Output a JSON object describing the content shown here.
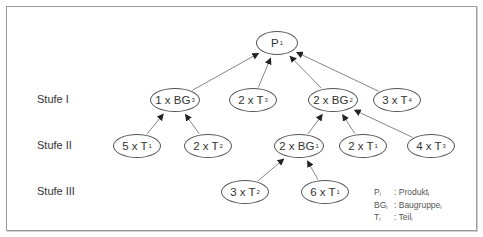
{
  "diagram": {
    "type": "tree",
    "direction": "bottom-up arrows (child to parent)",
    "levels": [
      {
        "id": "level-1",
        "label": "Stufe I",
        "y": 100
      },
      {
        "id": "level-2",
        "label": "Stufe II",
        "y": 146
      },
      {
        "id": "level-3",
        "label": "Stufe III",
        "y": 192
      }
    ],
    "nodes": [
      {
        "id": "p1",
        "qty": "",
        "sym": "P",
        "sub": "1",
        "cx": 277,
        "cy": 43,
        "w": 42,
        "h": 24
      },
      {
        "id": "bg3",
        "qty": "1 x ",
        "sym": "BG",
        "sub": "3",
        "cx": 175,
        "cy": 100,
        "w": 50,
        "h": 24
      },
      {
        "id": "t3a",
        "qty": "2 x ",
        "sym": "T",
        "sub": "3",
        "cx": 253,
        "cy": 100,
        "w": 48,
        "h": 24
      },
      {
        "id": "bg2",
        "qty": "2 x ",
        "sym": "BG",
        "sub": "2",
        "cx": 333,
        "cy": 100,
        "w": 50,
        "h": 24
      },
      {
        "id": "t4",
        "qty": "3 x ",
        "sym": "T",
        "sub": "4",
        "cx": 397,
        "cy": 100,
        "w": 48,
        "h": 24
      },
      {
        "id": "t1a",
        "qty": "5 x ",
        "sym": "T",
        "sub": "1",
        "cx": 137,
        "cy": 146,
        "w": 48,
        "h": 24
      },
      {
        "id": "t2a",
        "qty": "2 x ",
        "sym": "T",
        "sub": "2",
        "cx": 208,
        "cy": 146,
        "w": 48,
        "h": 24
      },
      {
        "id": "bg1",
        "qty": "2 x ",
        "sym": "BG",
        "sub": "1",
        "cx": 299,
        "cy": 146,
        "w": 50,
        "h": 24
      },
      {
        "id": "t1b",
        "qty": "2 x ",
        "sym": "T",
        "sub": "1",
        "cx": 363,
        "cy": 146,
        "w": 48,
        "h": 24
      },
      {
        "id": "t3b",
        "qty": "4 x ",
        "sym": "T",
        "sub": "3",
        "cx": 431,
        "cy": 146,
        "w": 48,
        "h": 24
      },
      {
        "id": "t2b",
        "qty": "3 x ",
        "sym": "T",
        "sub": "2",
        "cx": 245,
        "cy": 192,
        "w": 48,
        "h": 24
      },
      {
        "id": "t1c",
        "qty": "6 x ",
        "sym": "T",
        "sub": "1",
        "cx": 325,
        "cy": 192,
        "w": 48,
        "h": 24
      }
    ],
    "edges": [
      {
        "from": "bg3",
        "to": "p1"
      },
      {
        "from": "t3a",
        "to": "p1"
      },
      {
        "from": "bg2",
        "to": "p1"
      },
      {
        "from": "t4",
        "to": "p1"
      },
      {
        "from": "t1a",
        "to": "bg3"
      },
      {
        "from": "t2a",
        "to": "bg3"
      },
      {
        "from": "bg1",
        "to": "bg2"
      },
      {
        "from": "t1b",
        "to": "bg2"
      },
      {
        "from": "t3b",
        "to": "bg2"
      },
      {
        "from": "t2b",
        "to": "bg1"
      },
      {
        "from": "t1c",
        "to": "bg1"
      }
    ]
  },
  "legend": [
    {
      "sym": "P",
      "sub": "i",
      "text": ": Produkt",
      "tsub": "i"
    },
    {
      "sym": "BG",
      "sub": "i",
      "text": ": Baugruppe",
      "tsub": "i"
    },
    {
      "sym": "T",
      "sub": "i",
      "text": ": Teil",
      "tsub": "i"
    }
  ],
  "colors": {
    "line": "#555555",
    "frame": "#9a9a9a",
    "text": "#333333"
  }
}
